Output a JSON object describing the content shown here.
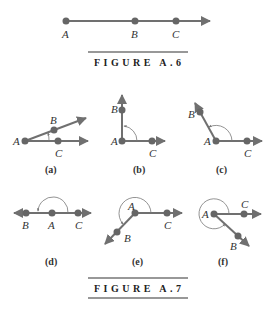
{
  "figure_a6": {
    "caption": "FIGURE A.6",
    "points": {
      "A": "A",
      "B": "B",
      "C": "C"
    }
  },
  "figure_a7": {
    "caption": "FIGURE A.7",
    "panels": [
      {
        "id": "a",
        "label": "(a)",
        "A": "A",
        "B": "B",
        "C": "C"
      },
      {
        "id": "b",
        "label": "(b)",
        "A": "A",
        "B": "B",
        "C": "C"
      },
      {
        "id": "c",
        "label": "(c)",
        "A": "A",
        "B": "B",
        "C": "C"
      },
      {
        "id": "d",
        "label": "(d)",
        "A": "A",
        "B": "B",
        "C": "C"
      },
      {
        "id": "e",
        "label": "(e)",
        "A": "A",
        "B": "B",
        "C": "C"
      },
      {
        "id": "f",
        "label": "(f)",
        "A": "A",
        "B": "B",
        "C": "C"
      }
    ]
  },
  "colors": {
    "ray": "#707070",
    "point": "#666666",
    "arc": "#777777",
    "text": "#333333"
  }
}
